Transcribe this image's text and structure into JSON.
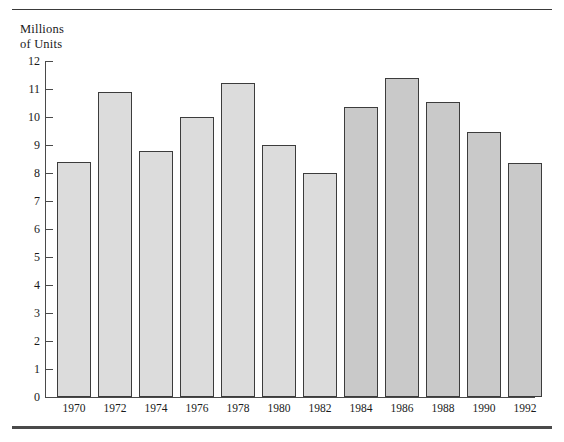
{
  "figure": {
    "axis_title_line1": "Millions",
    "axis_title_line2": "of Units",
    "rule_color": "#3a3a3a",
    "bar_fill_light": "#dcdcdc",
    "bar_fill_dark": "#c9c9c9",
    "bar_border": "#3c3c3c",
    "axis_color": "#4a4a4a"
  },
  "chart_data": {
    "type": "bar",
    "title": "",
    "xlabel": "",
    "ylabel": "Millions of Units",
    "ylim": [
      0,
      12
    ],
    "yticks": [
      0,
      1,
      2,
      3,
      4,
      5,
      6,
      7,
      8,
      9,
      10,
      11,
      12
    ],
    "ytick_labels": [
      "0",
      "1",
      "2",
      "3",
      "4",
      "5",
      "6",
      "7",
      "8",
      "9",
      "10",
      "11",
      "12"
    ],
    "grid": false,
    "legend": null,
    "categories": [
      "1970",
      "1972",
      "1974",
      "1976",
      "1978",
      "1980",
      "1982",
      "1984",
      "1986",
      "1988",
      "1990",
      "1992"
    ],
    "values": [
      8.4,
      10.9,
      8.8,
      10.0,
      11.2,
      9.0,
      8.0,
      10.35,
      11.4,
      10.55,
      9.45,
      8.35
    ],
    "shaded_darker_from_index": 7
  }
}
